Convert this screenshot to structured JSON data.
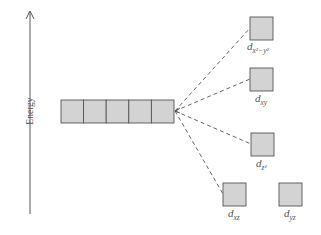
{
  "axis": {
    "label": "Energy"
  },
  "degenerate_set": {
    "box_count": 5,
    "fill": "#d3d3d3",
    "stroke": "#555555"
  },
  "split_orbitals": [
    {
      "id": "dx2y2",
      "label_main": "d",
      "label_sub": "x²−y²"
    },
    {
      "id": "dxy",
      "label_main": "d",
      "label_sub": "xy"
    },
    {
      "id": "dz2",
      "label_main": "d",
      "label_sub": "z²"
    },
    {
      "id": "dxz",
      "label_main": "d",
      "label_sub": "xz"
    },
    {
      "id": "dyz",
      "label_main": "d",
      "label_sub": "yz"
    }
  ],
  "colors": {
    "box_fill": "#d3d3d3",
    "box_stroke": "#555555",
    "line": "#555555"
  }
}
